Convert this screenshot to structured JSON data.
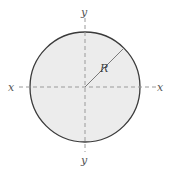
{
  "diagram": {
    "shape": "circle",
    "colors": {
      "fill": "#ececec",
      "outline": "#3a3a3a",
      "axis": "#999999",
      "radius_line": "#7a7a7a",
      "label": "#555555"
    },
    "labels": {
      "x_left": "x",
      "x_right": "x",
      "y_top": "y",
      "y_bottom": "y",
      "radius": "R"
    }
  }
}
